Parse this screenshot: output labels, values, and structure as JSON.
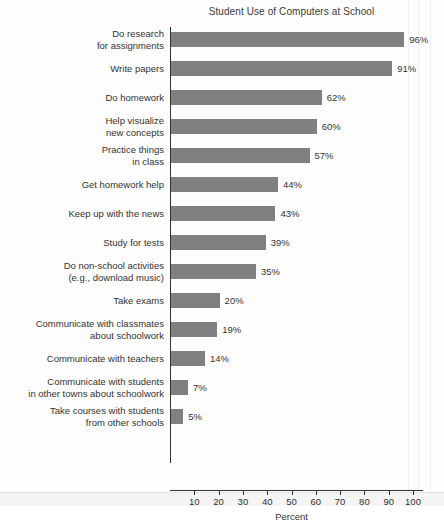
{
  "chart_data": {
    "type": "bar",
    "orientation": "horizontal",
    "title": "Student Use of Computers at School",
    "xlabel": "Percent",
    "ylabel": "",
    "xlim": [
      0,
      100
    ],
    "xticks": [
      10,
      20,
      30,
      40,
      50,
      60,
      70,
      80,
      90,
      100
    ],
    "grid": false,
    "legend": null,
    "bar_color": "#808080",
    "categories": [
      "Do research for assignments",
      "Write papers",
      "Do homework",
      "Help visualize new concepts",
      "Practice things in class",
      "Get homework help",
      "Keep up with the news",
      "Study for tests",
      "Do non-school activities (e.g., download music)",
      "Take exams",
      "Communicate with classmates about schoolwork",
      "Communicate with teachers",
      "Communicate with students in other towns about schoolwork",
      "Take courses with students from other schools"
    ],
    "values": [
      96,
      91,
      62,
      60,
      57,
      44,
      43,
      39,
      35,
      20,
      19,
      14,
      7,
      5
    ],
    "value_labels": [
      "96%",
      "91%",
      "62%",
      "60%",
      "57%",
      "44%",
      "43%",
      "39%",
      "35%",
      "20%",
      "19%",
      "14%",
      "7%",
      "5%"
    ]
  },
  "rows": [
    {
      "label_line1": "Do research",
      "label_line2": "for assignments",
      "value": 96,
      "value_label": "96%"
    },
    {
      "label_line1": "Write papers",
      "label_line2": "",
      "value": 91,
      "value_label": "91%"
    },
    {
      "label_line1": "Do homework",
      "label_line2": "",
      "value": 62,
      "value_label": "62%"
    },
    {
      "label_line1": "Help visualize",
      "label_line2": "new concepts",
      "value": 60,
      "value_label": "60%"
    },
    {
      "label_line1": "Practice things",
      "label_line2": "in class",
      "value": 57,
      "value_label": "57%"
    },
    {
      "label_line1": "Get homework help",
      "label_line2": "",
      "value": 44,
      "value_label": "44%"
    },
    {
      "label_line1": "Keep up with the news",
      "label_line2": "",
      "value": 43,
      "value_label": "43%"
    },
    {
      "label_line1": "Study for tests",
      "label_line2": "",
      "value": 39,
      "value_label": "39%"
    },
    {
      "label_line1": "Do non-school activities",
      "label_line2": "(e.g., download music)",
      "value": 35,
      "value_label": "35%"
    },
    {
      "label_line1": "Take exams",
      "label_line2": "",
      "value": 20,
      "value_label": "20%"
    },
    {
      "label_line1": "Communicate with classmates",
      "label_line2": "about schoolwork",
      "value": 19,
      "value_label": "19%"
    },
    {
      "label_line1": "Communicate with teachers",
      "label_line2": "",
      "value": 14,
      "value_label": "14%"
    },
    {
      "label_line1": "Communicate with students",
      "label_line2": "in other towns about schoolwork",
      "value": 7,
      "value_label": "7%"
    },
    {
      "label_line1": "Take courses with students",
      "label_line2": "from other schools",
      "value": 5,
      "value_label": "5%"
    }
  ],
  "axis": {
    "ticks": [
      "10",
      "20",
      "30",
      "40",
      "50",
      "60",
      "70",
      "80",
      "90",
      "100"
    ],
    "title": "Percent"
  }
}
